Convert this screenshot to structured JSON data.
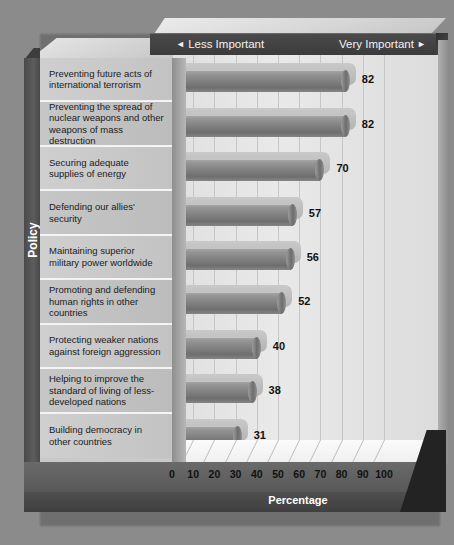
{
  "header": {
    "left_label": "Less Important",
    "right_label": "Very Important",
    "left_arrow": "◄",
    "right_arrow": "►"
  },
  "axes": {
    "y_title": "Policy",
    "x_title": "Percentage"
  },
  "chart_data": {
    "type": "bar",
    "orientation": "horizontal",
    "title": "",
    "xlabel": "Percentage",
    "ylabel": "Policy",
    "xlim": [
      0,
      100
    ],
    "xticks": [
      0,
      10,
      20,
      30,
      40,
      50,
      60,
      70,
      80,
      90,
      100
    ],
    "grid": true,
    "legend": null,
    "scale_anchor_low": "Less Important",
    "scale_anchor_high": "Very Important",
    "categories": [
      "Preventing future acts of international terrorism",
      "Preventing the spread of nuclear weapons and other weapons of mass destruction",
      "Securing adequate supplies of energy",
      "Defending our allies' security",
      "Maintaining superior military power worldwide",
      "Promoting and defending human rights in other countries",
      "Protecting weaker nations against foreign aggression",
      "Helping to improve the standard of living of less-developed nations",
      "Building democracy in other countries"
    ],
    "values": [
      82,
      82,
      70,
      57,
      56,
      52,
      40,
      38,
      31
    ],
    "value_labels": [
      "82",
      "82",
      "70",
      "57",
      "56",
      "52",
      "40",
      "38",
      "31"
    ]
  },
  "colors": {
    "background": "#8b8b8b",
    "header_band": "#3f3f3f",
    "bar_fill": "#7f7f7f",
    "plot_area": "#e4e4e4",
    "label_panel": "#c6c6c6",
    "base_slab": "#5c5c5c"
  }
}
